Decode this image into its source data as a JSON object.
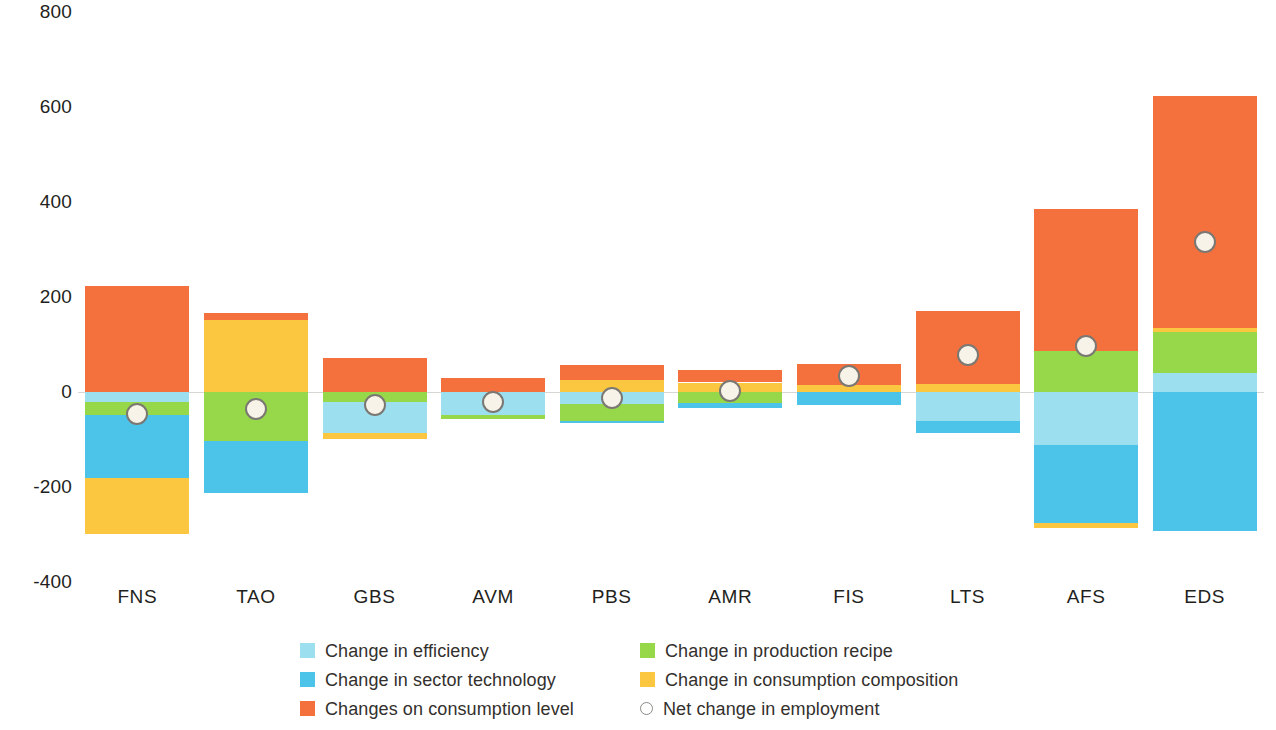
{
  "chart_data": {
    "type": "bar",
    "subtype": "stacked-bar-with-net-marker",
    "title": "",
    "subtitle": "",
    "xlabel": "",
    "ylabel": "",
    "ylim": [
      -400,
      800
    ],
    "yticks": [
      800,
      600,
      400,
      200,
      0,
      -200,
      -400
    ],
    "ytick_labels": [
      "800",
      "600",
      "400",
      "200",
      "0",
      "-200",
      "-400"
    ],
    "grid": false,
    "zero_line": true,
    "legend_position": "bottom",
    "categories": [
      "FNS",
      "TAO",
      "GBS",
      "AVM",
      "PBS",
      "AMR",
      "FIS",
      "LTS",
      "AFS",
      "EDS"
    ],
    "series": [
      {
        "name": "Change in efficiency",
        "color": "#9ce0f0",
        "values": [
          -22,
          0,
          -65,
          -48,
          -26,
          0,
          0,
          -61,
          -111,
          -41
        ]
      },
      {
        "name": "Change in production recipe",
        "color": "#96d84a",
        "values": [
          -26,
          -104,
          -22,
          -9,
          -35,
          -24,
          0,
          0,
          -87,
          85
        ]
      },
      {
        "name": "Change in sector technology",
        "color": "#4cc3e8",
        "values": [
          -133,
          -109,
          0,
          0,
          -4,
          -9,
          -28,
          -26,
          -165,
          -293
        ]
      },
      {
        "name": "Change in consumption composition",
        "color": "#fbc740",
        "values": [
          -117,
          152,
          -13,
          0,
          26,
          20,
          15,
          17,
          -11,
          9
        ]
      },
      {
        "name": "Changes on consumption level",
        "color": "#f4713e",
        "values": [
          224,
          15,
          72,
          30,
          30,
          26,
          44,
          154,
          298,
          489
        ]
      }
    ],
    "net_series": {
      "name": "Net change in employment",
      "marker": "open-circle",
      "values": [
        -46,
        -35,
        -28,
        -22,
        -13,
        2,
        33,
        78,
        96,
        315
      ]
    },
    "bar_pixel_stacks": {
      "note": "negative values stack downward from zero in the order efficiency, production recipe, sector technology, consumption composition; positive values stack upward starting with consumption level",
      "FNS": {
        "up": [
          "Changes on consumption level"
        ],
        "down": [
          "Change in efficiency",
          "Change in production recipe",
          "Change in sector technology",
          "Change in consumption composition"
        ]
      },
      "TAO": {
        "up": [
          "Change in consumption composition",
          "Changes on consumption level"
        ],
        "down": [
          "Change in production recipe",
          "Change in sector technology"
        ]
      },
      "GBS": {
        "up": [
          "Changes on consumption level"
        ],
        "down": [
          "Change in production recipe",
          "Change in efficiency",
          "Change in consumption composition"
        ]
      },
      "AVM": {
        "up": [
          "Changes on consumption level"
        ],
        "down": [
          "Change in efficiency",
          "Change in production recipe"
        ]
      },
      "PBS": {
        "up": [
          "Change in consumption composition",
          "Changes on consumption level"
        ],
        "down": [
          "Change in efficiency",
          "Change in production recipe",
          "Change in sector technology"
        ]
      },
      "AMR": {
        "up": [
          "Change in consumption composition",
          "Changes on consumption level"
        ],
        "down": [
          "Change in production recipe",
          "Change in sector technology"
        ]
      },
      "FIS": {
        "up": [
          "Change in consumption composition",
          "Changes on consumption level"
        ],
        "down": [
          "Change in sector technology"
        ]
      },
      "LTS": {
        "up": [
          "Change in consumption composition",
          "Changes on consumption level"
        ],
        "down": [
          "Change in efficiency",
          "Change in sector technology"
        ]
      },
      "AFS": {
        "up": [
          "Change in production recipe",
          "Changes on consumption level"
        ],
        "down": [
          "Change in efficiency",
          "Change in sector technology",
          "Change in consumption composition"
        ]
      },
      "EDS": {
        "up": [
          "Change in efficiency",
          "Change in production recipe",
          "Change in consumption composition",
          "Changes on consumption level"
        ],
        "down": [
          "Change in sector technology"
        ]
      }
    }
  },
  "axes": {
    "y_tick_labels": [
      "800",
      "600",
      "400",
      "200",
      "0",
      "-200",
      "-400"
    ],
    "x_tick_labels": [
      "FNS",
      "TAO",
      "GBS",
      "AVM",
      "PBS",
      "AMR",
      "FIS",
      "LTS",
      "AFS",
      "EDS"
    ]
  },
  "legend": {
    "rows": [
      {
        "left": {
          "label": "Change in efficiency",
          "swatch": "color",
          "color": "#9ce0f0"
        },
        "right": {
          "label": "Change in production recipe",
          "swatch": "color",
          "color": "#96d84a"
        }
      },
      {
        "left": {
          "label": "Change in sector technology",
          "swatch": "color",
          "color": "#4cc3e8"
        },
        "right": {
          "label": "Change in consumption composition",
          "swatch": "color",
          "color": "#fbc740"
        }
      },
      {
        "left": {
          "label": "Changes on consumption level",
          "swatch": "color",
          "color": "#f4713e"
        },
        "right": {
          "label": "Net change in employment",
          "swatch": "ring",
          "color": "#ffffff"
        }
      }
    ]
  },
  "colors": {
    "efficiency": "#9ce0f0",
    "production_recipe": "#96d84a",
    "sector_technology": "#4cc3e8",
    "consumption_composition": "#fbc740",
    "consumption_level": "#f4713e",
    "net_marker_fill": "#f7f3e8",
    "net_marker_stroke": "#7b7873",
    "zero_line": "#d8d6d2",
    "text": "#231f20",
    "background": "#ffffff"
  }
}
